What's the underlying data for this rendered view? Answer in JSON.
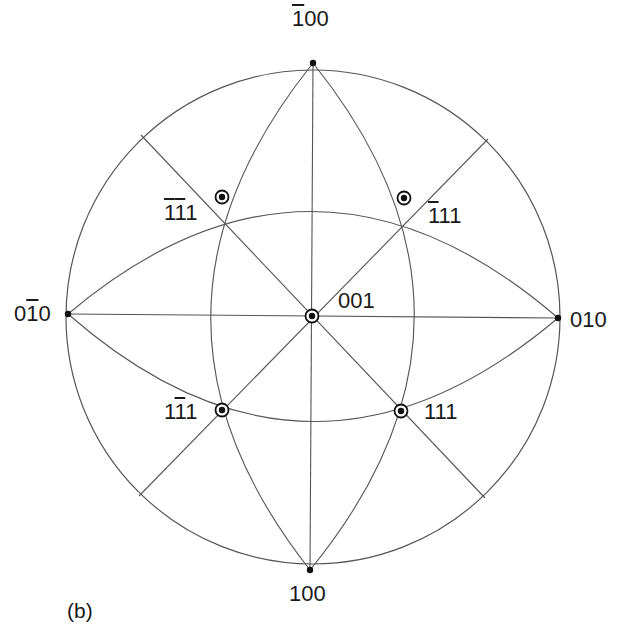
{
  "figure": {
    "panel_label": "(b)",
    "type": "stereographic projection",
    "colors": {
      "line": "#555555",
      "pole": "#111111",
      "text": "#1a1a1a",
      "background": "#ffffff"
    },
    "primitive_circle": {
      "cx": 313,
      "cy": 317,
      "r": 247
    },
    "poles": [
      {
        "id": "p-100bar",
        "digits": [
          "1",
          "0",
          "0"
        ],
        "bars": [
          true,
          false,
          false
        ],
        "text": "Ā1 0 0",
        "x": 313,
        "y": 63,
        "marker": "dot",
        "label_x": 292,
        "label_y": 8
      },
      {
        "id": "p-100",
        "digits": [
          "1",
          "0",
          "0"
        ],
        "bars": [
          false,
          false,
          false
        ],
        "x": 310,
        "y": 570,
        "marker": "dot",
        "label_x": 289,
        "label_y": 583
      },
      {
        "id": "p-010bar",
        "digits": [
          "0",
          "1",
          "0"
        ],
        "bars": [
          false,
          true,
          false
        ],
        "x": 68,
        "y": 314,
        "marker": "dot",
        "label_x": 14,
        "label_y": 303
      },
      {
        "id": "p-010",
        "digits": [
          "0",
          "1",
          "0"
        ],
        "bars": [
          false,
          false,
          false
        ],
        "x": 558,
        "y": 318,
        "marker": "dot",
        "label_x": 570,
        "label_y": 309
      },
      {
        "id": "p-001",
        "digits": [
          "0",
          "0",
          "1"
        ],
        "bars": [
          false,
          false,
          false
        ],
        "x": 312,
        "y": 316,
        "marker": "ring",
        "label_x": 338,
        "label_y": 290
      },
      {
        "id": "p-1bar1bar1",
        "digits": [
          "1",
          "1",
          "1"
        ],
        "bars": [
          true,
          true,
          false
        ],
        "x": 222,
        "y": 197,
        "marker": "ring",
        "label_x": 164,
        "label_y": 202
      },
      {
        "id": "p-1bar11",
        "digits": [
          "1",
          "1",
          "1"
        ],
        "bars": [
          true,
          false,
          false
        ],
        "x": 404,
        "y": 198,
        "marker": "ring",
        "label_x": 428,
        "label_y": 205
      },
      {
        "id": "p-11bar1",
        "digits": [
          "1",
          "1",
          "1"
        ],
        "bars": [
          false,
          true,
          false
        ],
        "x": 222,
        "y": 410,
        "marker": "ring",
        "label_x": 164,
        "label_y": 401
      },
      {
        "id": "p-111",
        "digits": [
          "1",
          "1",
          "1"
        ],
        "bars": [
          false,
          false,
          false
        ],
        "x": 401,
        "y": 411,
        "marker": "ring",
        "label_x": 424,
        "label_y": 401
      }
    ],
    "great_circles": [
      {
        "name": "vertical-diameter",
        "type": "line",
        "x1": 313,
        "y1": 63,
        "x2": 310,
        "y2": 570
      },
      {
        "name": "horizontal-diameter",
        "type": "line",
        "x1": 68,
        "y1": 314,
        "x2": 558,
        "y2": 318
      },
      {
        "name": "diagonal-nw-se",
        "type": "line",
        "x1": 141,
        "y1": 135,
        "x2": 485,
        "y2": 498
      },
      {
        "name": "diagonal-ne-sw",
        "type": "line",
        "x1": 488,
        "y1": 139,
        "x2": 139,
        "y2": 496
      },
      {
        "name": "arc-left-vertical",
        "type": "path",
        "d": "M313,63 Q110,316 310,570"
      },
      {
        "name": "arc-right-vertical",
        "type": "path",
        "d": "M313,63 Q517,317 310,570"
      },
      {
        "name": "arc-top-horizontal",
        "type": "path",
        "d": "M68,314 Q313,107 558,318"
      },
      {
        "name": "arc-bottom-horizontal",
        "type": "path",
        "d": "M68,314 Q311,527 558,318"
      }
    ]
  }
}
